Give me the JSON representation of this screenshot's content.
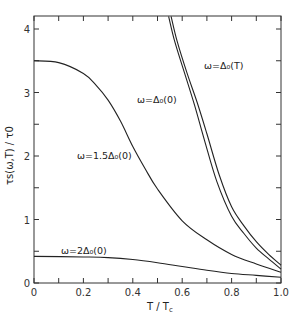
{
  "chart_data": {
    "type": "line",
    "title": "",
    "xlabel": "T / T_c",
    "ylabel": "τ_s(ω,T) / τ_0",
    "xlim": [
      0,
      1.0
    ],
    "ylim": [
      0,
      4.2
    ],
    "xticks": [
      "0",
      "0.2",
      "0.4",
      "0.6",
      "0.8",
      "1.0"
    ],
    "yticks": [
      "0",
      "1",
      "2",
      "3",
      "4"
    ],
    "grid": false,
    "series": [
      {
        "name": "ω=Δ0(T)",
        "x": [
          0.555,
          0.58,
          0.62,
          0.66,
          0.7,
          0.75,
          0.8,
          0.85,
          0.9,
          0.95,
          1.0
        ],
        "values": [
          4.2,
          3.8,
          3.3,
          2.85,
          2.35,
          1.7,
          1.2,
          0.9,
          0.65,
          0.45,
          0.28
        ]
      },
      {
        "name": "ω=Δ0(0)",
        "x": [
          0.545,
          0.57,
          0.61,
          0.65,
          0.69,
          0.74,
          0.8,
          0.85,
          0.9,
          0.95,
          1.0
        ],
        "values": [
          4.2,
          3.8,
          3.3,
          2.8,
          2.25,
          1.6,
          1.05,
          0.78,
          0.55,
          0.38,
          0.22
        ]
      },
      {
        "name": "ω=1.5Δ0(0)",
        "x": [
          0,
          0.1,
          0.2,
          0.25,
          0.3,
          0.35,
          0.4,
          0.45,
          0.5,
          0.6,
          0.7,
          0.8,
          0.9,
          1.0
        ],
        "values": [
          3.5,
          3.47,
          3.3,
          3.12,
          2.88,
          2.55,
          2.15,
          1.8,
          1.48,
          0.98,
          0.68,
          0.45,
          0.3,
          0.17
        ]
      },
      {
        "name": "ω=2Δ0(0)",
        "x": [
          0,
          0.2,
          0.3,
          0.4,
          0.5,
          0.6,
          0.7,
          0.8,
          0.9,
          1.0
        ],
        "values": [
          0.42,
          0.41,
          0.4,
          0.37,
          0.32,
          0.26,
          0.2,
          0.15,
          0.12,
          0.09
        ]
      }
    ],
    "annotations": [
      {
        "text": "ω=Δ₀(T)",
        "x": 0.64,
        "y": 3.6
      },
      {
        "text": "ω=Δ₀(0)",
        "x": 0.42,
        "y": 2.9
      },
      {
        "text": "ω=1.5Δ₀(0)",
        "x": 0.18,
        "y": 2.05
      },
      {
        "text": "ω=2Δ₀(0)",
        "x": 0.1,
        "y": 0.52
      }
    ]
  },
  "labels": {
    "xlabel": "T / T",
    "xlabel_sub": "c",
    "ylabel": "τs(ω,T) / τ0",
    "ann_delta_t": "ω=Δ₀(T)",
    "ann_delta_0": "ω=Δ₀(0)",
    "ann_15": "ω=1.5Δ₀(0)",
    "ann_2": "ω=2Δ₀(0)"
  }
}
